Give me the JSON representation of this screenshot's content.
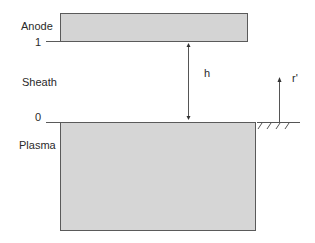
{
  "diagram": {
    "labels": {
      "anode": "Anode",
      "sheath": "Sheath",
      "plasma": "Plasma",
      "level_top": "1",
      "level_bottom": "0",
      "gap": "h",
      "coordinate": "r'"
    },
    "colors": {
      "fill": "#d4d4d4",
      "stroke": "#5a5a5a",
      "text": "#2a2a2a"
    }
  }
}
